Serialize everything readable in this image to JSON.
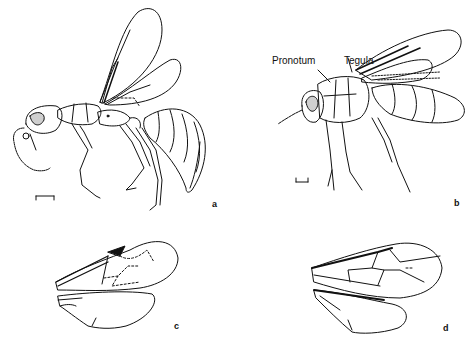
{
  "figure": {
    "panels": [
      {
        "id": "a",
        "label": "a",
        "content": "winged wasp, lateral view, with scale bar"
      },
      {
        "id": "b",
        "label": "b",
        "content": "winged wasp, lateral view, with scale bar"
      },
      {
        "id": "c",
        "label": "c",
        "content": "fore and hind wing venation"
      },
      {
        "id": "d",
        "label": "d",
        "content": "fore and hind wing venation"
      }
    ],
    "annotations": {
      "pronotum": "Pronotum",
      "tegula": "Tegula"
    },
    "colors": {
      "line": "#111111",
      "background": "#ffffff",
      "eye_fill": "#cfcfcf"
    }
  }
}
